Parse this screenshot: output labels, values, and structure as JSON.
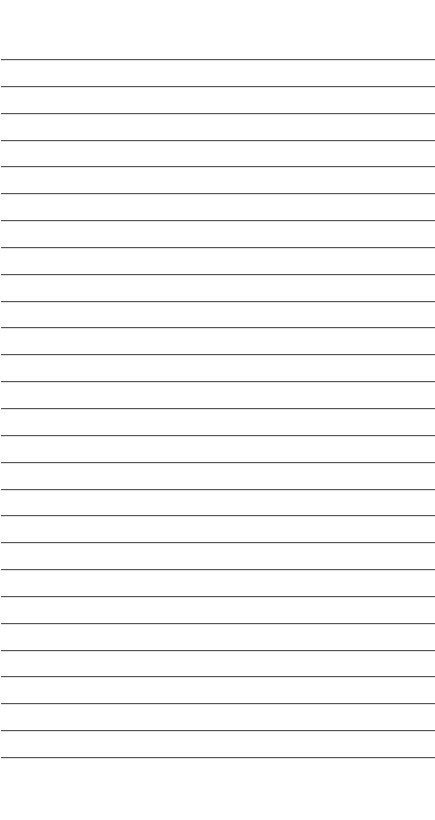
{
  "document": {
    "type": "lined-paper",
    "ruled_line_count": 27,
    "line_color": "#555555",
    "background_color": "#ffffff",
    "text_content": []
  }
}
